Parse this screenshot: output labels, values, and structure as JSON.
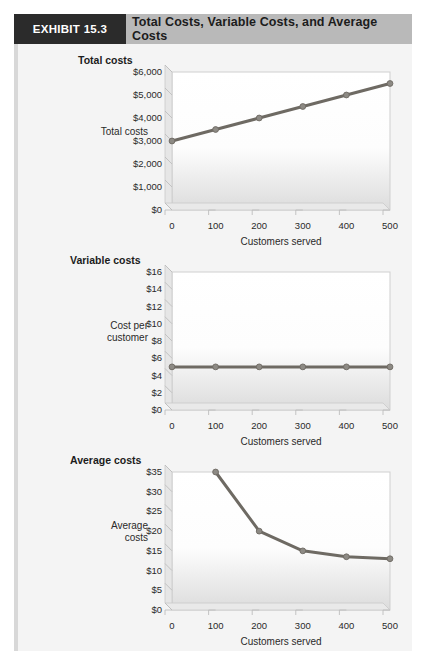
{
  "header": {
    "exhibit_tag": "EXHIBIT 15.3",
    "title": "Total Costs, Variable Costs, and Average Costs"
  },
  "style": {
    "tag_bg": "#2b2b2b",
    "tag_fg": "#ffffff",
    "header_bg": "#b9b9b9",
    "panel_bg": "#f2f2f2",
    "line_color": "#6e6a63",
    "marker_color": "#8d8a84",
    "axis_color": "#a9a9a9",
    "plot_top_color": "#ffffff",
    "plot_bottom_color": "#dcdcdc"
  },
  "chart_data": [
    {
      "type": "line",
      "title": "Total costs",
      "ylabel": "Total costs",
      "xlabel": "Customers served",
      "x": [
        0,
        100,
        200,
        300,
        400,
        500
      ],
      "values": [
        3000,
        3500,
        4000,
        4500,
        5000,
        5500
      ],
      "xticks": [
        "0",
        "100",
        "200",
        "300",
        "400",
        "500"
      ],
      "yticks": [
        "$0",
        "$1,000",
        "$2,000",
        "$3,000",
        "$4,000",
        "$5,000",
        "$6,000"
      ],
      "ytickvals": [
        0,
        1000,
        2000,
        3000,
        4000,
        5000,
        6000
      ],
      "xlim": [
        0,
        500
      ],
      "ylim": [
        0,
        6000
      ],
      "grid": false,
      "legend": "none"
    },
    {
      "type": "line",
      "title": "Variable costs",
      "ylabel": "Cost per customer",
      "xlabel": "Customers served",
      "x": [
        0,
        100,
        200,
        300,
        400,
        500
      ],
      "values": [
        5,
        5,
        5,
        5,
        5,
        5
      ],
      "xticks": [
        "0",
        "100",
        "200",
        "300",
        "400",
        "500"
      ],
      "yticks": [
        "$0",
        "$2",
        "$4",
        "$6",
        "$8",
        "$10",
        "$12",
        "$14",
        "$16"
      ],
      "ytickvals": [
        0,
        2,
        4,
        6,
        8,
        10,
        12,
        14,
        16
      ],
      "xlim": [
        0,
        500
      ],
      "ylim": [
        0,
        16
      ],
      "grid": false,
      "legend": "none"
    },
    {
      "type": "line",
      "title": "Average costs",
      "ylabel": "Average costs",
      "xlabel": "Customers served",
      "x": [
        100,
        200,
        300,
        400,
        500
      ],
      "values": [
        35,
        20,
        15,
        13.5,
        13
      ],
      "xticks": [
        "0",
        "100",
        "200",
        "300",
        "400",
        "500"
      ],
      "yticks": [
        "$0",
        "$5",
        "$10",
        "$15",
        "$20",
        "$25",
        "$30",
        "$35"
      ],
      "ytickvals": [
        0,
        5,
        10,
        15,
        20,
        25,
        30,
        35
      ],
      "xlim": [
        0,
        500
      ],
      "ylim": [
        0,
        35
      ],
      "grid": false,
      "legend": "none"
    }
  ]
}
